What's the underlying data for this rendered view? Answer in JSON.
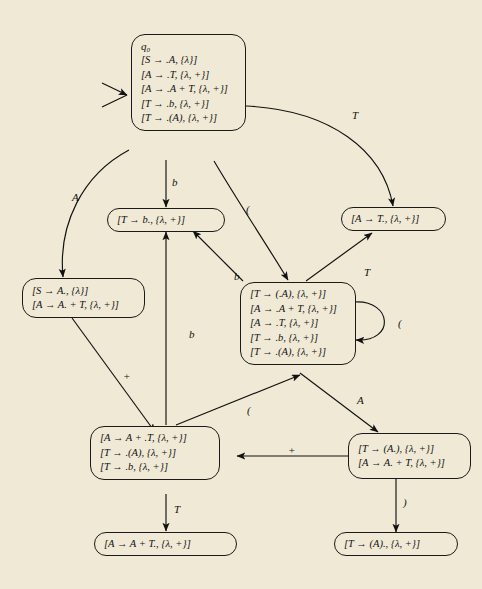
{
  "diagram": {
    "background_color": "#efe9d6",
    "ink_color": "#111111",
    "start_marker": "start-arrow"
  },
  "states": [
    {
      "id": "q0",
      "name": "state-q0",
      "label": "q0",
      "label_text": "q₀",
      "items": [
        "[S → .A, {λ}]",
        "[A → .T, {λ, +}]",
        "[A → .A + T, {λ, +}]",
        "[T → .b, {λ, +}]",
        "[T → .(A), {λ, +}]"
      ]
    },
    {
      "id": "s_b",
      "name": "state-t-b-dot",
      "label": "",
      "items": [
        "[T → b., {λ, +}]"
      ]
    },
    {
      "id": "s_Tdot",
      "name": "state-a-t-dot",
      "label": "",
      "items": [
        "[A → T., {λ, +}]"
      ]
    },
    {
      "id": "s_Adot",
      "name": "state-s-a-dot",
      "label": "",
      "items": [
        "[S → A., {λ}]",
        "[A → A. + T, {λ, +}]"
      ]
    },
    {
      "id": "s_paren",
      "name": "state-t-open-paren",
      "label": "",
      "items": [
        "[T → (.A), {λ, +}]",
        "[A → .A + T, {λ, +}]",
        "[A → .T, {λ, +}]",
        "[T → .b, {λ, +}]",
        "[T → .(A), {λ, +}]"
      ]
    },
    {
      "id": "s_plus",
      "name": "state-a-a-plus-dot-t",
      "label": "",
      "items": [
        "[A → A + .T, {λ, +}]",
        "[T →  .(A), {λ, +}]",
        "[T → .b, {λ, +}]"
      ]
    },
    {
      "id": "s_AparenDot",
      "name": "state-t-paren-a-dot",
      "label": "",
      "items": [
        "[T → (A.), {λ, +}]",
        "[A → A. + T, {λ, +}]"
      ]
    },
    {
      "id": "s_APlusTdot",
      "name": "state-a-a-plus-t-dot",
      "label": "",
      "items": [
        "[A → A + T., {λ, +}]"
      ]
    },
    {
      "id": "s_parenAdot",
      "name": "state-t-paren-a-close-dot",
      "label": "",
      "items": [
        "[T → (A)., {λ, +}]"
      ]
    }
  ],
  "edges": [
    {
      "name": "edge-q0-to-sAdot",
      "label": "A",
      "from": "q0",
      "to": "s_Adot"
    },
    {
      "name": "edge-q0-to-sb",
      "label": "b",
      "from": "q0",
      "to": "s_b"
    },
    {
      "name": "edge-q0-to-sTdot",
      "label": "T",
      "from": "q0",
      "to": "s_Tdot"
    },
    {
      "name": "edge-q0-to-sparen",
      "label": "(",
      "from": "q0",
      "to": "s_paren"
    },
    {
      "name": "edge-sparen-to-sb",
      "label": "b",
      "from": "s_paren",
      "to": "s_b"
    },
    {
      "name": "edge-sparen-to-sTdot",
      "label": "T",
      "from": "s_paren",
      "to": "s_Tdot"
    },
    {
      "name": "edge-sparen-self",
      "label": "(",
      "from": "s_paren",
      "to": "s_paren"
    },
    {
      "name": "edge-sparen-to-sAparenDot",
      "label": "A",
      "from": "s_paren",
      "to": "s_AparenDot"
    },
    {
      "name": "edge-sAdot-to-splus",
      "label": "+",
      "from": "s_Adot",
      "to": "s_plus"
    },
    {
      "name": "edge-splus-to-sb",
      "label": "b",
      "from": "s_plus",
      "to": "s_b"
    },
    {
      "name": "edge-splus-to-sparen",
      "label": "(",
      "from": "s_plus",
      "to": "s_paren"
    },
    {
      "name": "edge-splus-to-sAPlusTdot",
      "label": "T",
      "from": "s_plus",
      "to": "s_APlusTdot"
    },
    {
      "name": "edge-sAparenDot-to-splus",
      "label": "+",
      "from": "s_AparenDot",
      "to": "s_plus"
    },
    {
      "name": "edge-sAparenDot-to-sparenAdot",
      "label": ")",
      "from": "s_AparenDot",
      "to": "s_parenAdot"
    }
  ]
}
